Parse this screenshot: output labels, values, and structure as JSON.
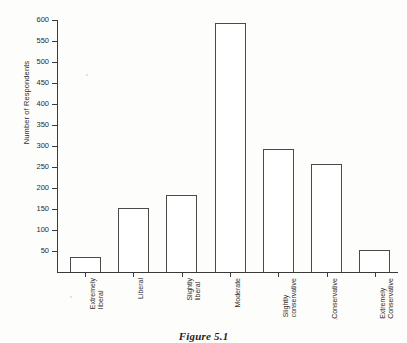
{
  "figure": {
    "caption": "Figure 5.1"
  },
  "chart_data": {
    "type": "bar",
    "title": "",
    "xlabel": "",
    "ylabel": "Number of Respondents",
    "ylim": [
      0,
      600
    ],
    "ytick_step": 50,
    "yticks": [
      50,
      100,
      150,
      200,
      250,
      300,
      350,
      400,
      450,
      500,
      550,
      600
    ],
    "grid": false,
    "legend": "none",
    "bar_style": {
      "fill": "#ffffff",
      "edge": "#4a4a4a"
    },
    "categories": [
      "Extremely liberal",
      "Liberal",
      "Slightly liberal",
      "Moderate",
      "Slightly conservative",
      "Conservative",
      "Extremely Conservative"
    ],
    "category_lines": [
      [
        "Extremely",
        "liberal"
      ],
      [
        "Liberal",
        ""
      ],
      [
        "Slightly",
        "liberal"
      ],
      [
        "Moderate",
        ""
      ],
      [
        "Slightly",
        "conservative"
      ],
      [
        "Conservative",
        ""
      ],
      [
        "Extremely",
        "Conservative"
      ]
    ],
    "values": [
      35,
      152,
      183,
      592,
      294,
      258,
      52
    ]
  }
}
